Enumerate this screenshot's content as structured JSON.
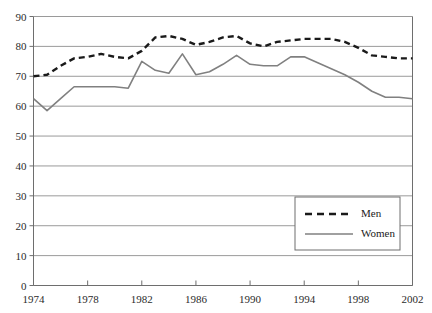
{
  "chart_data": {
    "type": "line",
    "title": "",
    "xlabel": "",
    "ylabel": "",
    "xlim": [
      1974,
      2002
    ],
    "ylim": [
      0,
      90
    ],
    "grid": true,
    "grid_axis": "y",
    "legend_position": "bottom-right",
    "y_ticks": [
      0,
      10,
      20,
      30,
      40,
      50,
      60,
      70,
      80,
      90
    ],
    "y_tick_labels": [
      "0",
      "10",
      "20",
      "30",
      "40",
      "50",
      "60",
      "70",
      "80",
      "90"
    ],
    "x_ticks": [
      1974,
      1978,
      1982,
      1986,
      1990,
      1994,
      1998,
      2002
    ],
    "x_tick_labels": [
      "1974",
      "1978",
      "1982",
      "1986",
      "1990",
      "1994",
      "1998",
      "2002"
    ],
    "x": [
      1974,
      1975,
      1976,
      1977,
      1978,
      1979,
      1980,
      1981,
      1982,
      1983,
      1984,
      1985,
      1986,
      1987,
      1988,
      1989,
      1990,
      1991,
      1992,
      1993,
      1994,
      1995,
      1996,
      1997,
      1998,
      1999,
      2000,
      2001,
      2002
    ],
    "series": [
      {
        "name": "Men",
        "style": "dashed",
        "color": "#1a1a1a",
        "values": [
          70.0,
          70.5,
          73.5,
          76.0,
          76.5,
          77.5,
          76.5,
          76.0,
          78.5,
          83.0,
          83.5,
          82.5,
          80.5,
          81.5,
          83.0,
          83.5,
          81.0,
          80.0,
          81.5,
          82.0,
          82.5,
          82.5,
          82.5,
          81.5,
          79.5,
          77.0,
          76.5,
          76.0,
          76.0
        ]
      },
      {
        "name": "Women",
        "style": "solid",
        "color": "#808080",
        "values": [
          62.5,
          58.5,
          62.5,
          66.5,
          66.5,
          66.5,
          66.5,
          66.0,
          75.0,
          72.0,
          71.0,
          77.5,
          70.5,
          71.5,
          74.0,
          77.0,
          74.0,
          73.5,
          73.5,
          76.5,
          76.5,
          74.5,
          72.5,
          70.5,
          68.0,
          65.0,
          63.0,
          63.0,
          62.5
        ]
      }
    ]
  },
  "legend": {
    "entries": [
      {
        "label": "Men"
      },
      {
        "label": "Women"
      }
    ]
  }
}
